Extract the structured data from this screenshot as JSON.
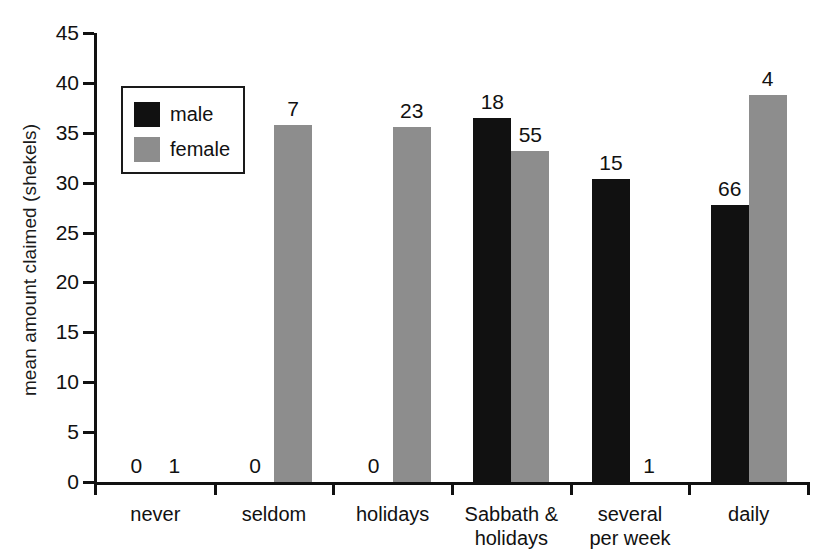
{
  "chart_data": {
    "type": "bar",
    "title": "",
    "xlabel": "",
    "ylabel": "mean amount claimed (shekels)",
    "ylim": [
      0,
      45
    ],
    "yticks": [
      0,
      5,
      10,
      15,
      20,
      25,
      30,
      35,
      40,
      45
    ],
    "grid": false,
    "legend_position": "upper-left-inside",
    "categories": [
      "never",
      "seldom",
      "holidays",
      "Sabbath & holidays",
      "several per week",
      "daily"
    ],
    "category_lines": [
      [
        "never"
      ],
      [
        "seldom"
      ],
      [
        "holidays"
      ],
      [
        "Sabbath &",
        "holidays"
      ],
      [
        "several",
        "per week"
      ],
      [
        "daily"
      ]
    ],
    "series": [
      {
        "name": "male",
        "color": "#111111",
        "values": [
          0,
          0,
          0,
          36.5,
          30.4,
          27.8
        ],
        "sample_sizes": [
          0,
          0,
          0,
          18,
          15,
          66
        ]
      },
      {
        "name": "female",
        "color": "#8d8d8d",
        "values": [
          0,
          35.8,
          35.6,
          33.2,
          0,
          38.8
        ],
        "sample_sizes": [
          1,
          7,
          23,
          55,
          1,
          4
        ]
      }
    ],
    "bar_labels_meaning": "sample size (n) printed above each bar"
  },
  "legend": {
    "entries": [
      {
        "label": "male",
        "color": "#111111"
      },
      {
        "label": "female",
        "color": "#8d8d8d"
      }
    ]
  }
}
